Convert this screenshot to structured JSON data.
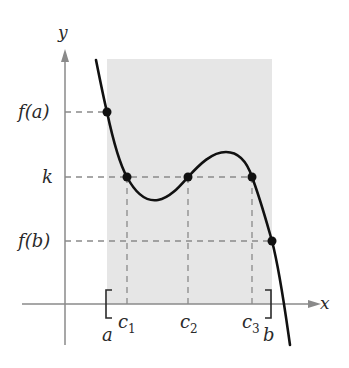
{
  "figure": {
    "type": "intermediate-value-theorem-diagram",
    "axes": {
      "x_label": "x",
      "y_label": "y"
    },
    "y_labels": {
      "fa": "f(a)",
      "k": "k",
      "fb": "f(b)"
    },
    "x_labels": {
      "a": "a",
      "b": "b",
      "c1": "c",
      "c1_sub": "1",
      "c2": "c",
      "c2_sub": "2",
      "c3": "c",
      "c3_sub": "3"
    },
    "interval": {
      "left_bracket": "[",
      "right_bracket": "]"
    },
    "colors": {
      "shade": "#e6e6e6",
      "axis": "#8a8a8a",
      "curve": "#111111",
      "dash": "#8a8a8a",
      "point": "#111111"
    }
  }
}
